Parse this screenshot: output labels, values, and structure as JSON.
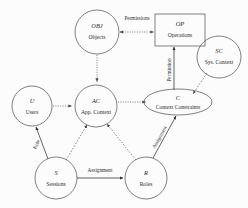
{
  "diagram": {
    "type": "entity-relationship",
    "background_color": "#fcfcfc",
    "line_color": "#4a4a4a",
    "text_color": "#2b2b2b",
    "nodes": [
      {
        "id": "obj",
        "abbr": "OBJ",
        "name": "Objects",
        "shape": "circle",
        "cx": 97,
        "cy": 32,
        "rx": 22,
        "ry": 22
      },
      {
        "id": "op",
        "abbr": "OP",
        "name": "Operations",
        "shape": "rectangle",
        "cx": 180,
        "cy": 30,
        "rx": 25,
        "ry": 16
      },
      {
        "id": "sc",
        "abbr": "SC",
        "name": "Sys. Context",
        "shape": "circle",
        "cx": 219,
        "cy": 57,
        "rx": 22,
        "ry": 21
      },
      {
        "id": "ac",
        "abbr": "AC",
        "name": "App. Context",
        "shape": "circle",
        "cx": 96,
        "cy": 106,
        "rx": 21,
        "ry": 21
      },
      {
        "id": "u",
        "abbr": "U",
        "name": "Users",
        "shape": "circle",
        "cx": 32,
        "cy": 106,
        "rx": 20,
        "ry": 20
      },
      {
        "id": "c",
        "abbr": "C",
        "name": "Context Constraints",
        "shape": "ellipse",
        "cx": 178,
        "cy": 102,
        "rx": 34,
        "ry": 13
      },
      {
        "id": "s",
        "abbr": "S",
        "name": "Sessions",
        "shape": "circle",
        "cx": 56,
        "cy": 178,
        "rx": 21,
        "ry": 21
      },
      {
        "id": "r",
        "abbr": "R",
        "name": "Roles",
        "shape": "circle",
        "cx": 146,
        "cy": 178,
        "rx": 21,
        "ry": 21
      }
    ],
    "edges": [
      {
        "id": "obj-op",
        "from": "obj",
        "to": "op",
        "label": "Permissions",
        "style": "dotted",
        "arrows": "both"
      },
      {
        "id": "op-c",
        "from": "op",
        "to": "c",
        "label": "Permission",
        "style": "solid",
        "arrows": "to-op",
        "label_rotation": -90
      },
      {
        "id": "obj-ac",
        "from": "obj",
        "to": "ac",
        "label": "",
        "style": "dotted",
        "arrows": "to"
      },
      {
        "id": "u-ac",
        "from": "u",
        "to": "ac",
        "label": "",
        "style": "dotted",
        "arrows": "to"
      },
      {
        "id": "ac-c",
        "from": "ac",
        "to": "c",
        "label": "",
        "style": "dotted",
        "arrows": "to"
      },
      {
        "id": "sc-c",
        "from": "sc",
        "to": "c",
        "label": "",
        "style": "dashed",
        "arrows": "to"
      },
      {
        "id": "u-s",
        "from": "u",
        "to": "s",
        "label": "Role",
        "style": "solid",
        "arrows": "to-u",
        "label_rotation": -62
      },
      {
        "id": "s-ac",
        "from": "s",
        "to": "ac",
        "label": "",
        "style": "dashed",
        "arrows": "to"
      },
      {
        "id": "r-ac",
        "from": "r",
        "to": "ac",
        "label": "",
        "style": "dashed",
        "arrows": "to"
      },
      {
        "id": "s-r",
        "from": "s",
        "to": "r",
        "label": "Assignment",
        "style": "solid",
        "arrows": "to"
      },
      {
        "id": "r-c",
        "from": "r",
        "to": "c",
        "label": "Assignment",
        "style": "solid",
        "arrows": "to",
        "label_rotation": -62
      }
    ]
  }
}
